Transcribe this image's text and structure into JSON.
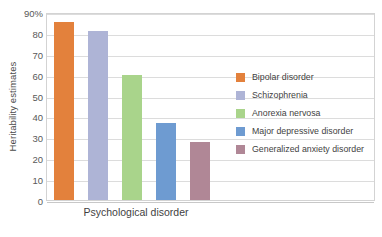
{
  "chart_data": {
    "type": "bar",
    "title": "",
    "xlabel": "Psychological disorder",
    "ylabel": "Heritability estimates",
    "categories": [
      "Bipolar disorder",
      "Schizophrenia",
      "Anorexia nervosa",
      "Major depressive disorder",
      "Generalized anxiety disorder"
    ],
    "values": [
      85,
      81,
      60,
      37,
      28
    ],
    "colors": [
      "#E3813C",
      "#AEB4D6",
      "#A9D48B",
      "#6E9BD1",
      "#B08796"
    ],
    "ylim": [
      0,
      90
    ],
    "ytick_values": [
      0,
      10,
      20,
      30,
      40,
      50,
      60,
      70,
      80,
      90
    ],
    "ytick_labels": [
      "0",
      "10",
      "20",
      "30",
      "40",
      "50",
      "60",
      "70",
      "80",
      "90%"
    ],
    "xtick_labels": [],
    "grid": "horizontal",
    "legend_position": "right",
    "legend_entries": [
      {
        "label": "Bipolar disorder",
        "color": "#E3813C"
      },
      {
        "label": "Schizophrenia",
        "color": "#AEB4D6"
      },
      {
        "label": "Anorexia nervosa",
        "color": "#A9D48B"
      },
      {
        "label": "Major depressive disorder",
        "color": "#6E9BD1"
      },
      {
        "label": "Generalized anxiety disorder",
        "color": "#B08796"
      }
    ]
  }
}
